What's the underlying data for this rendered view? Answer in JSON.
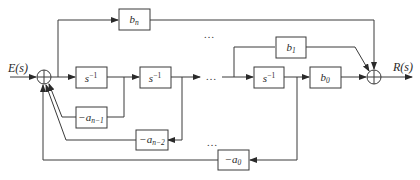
{
  "diagram": {
    "type": "block diagram (controllable canonical form)",
    "input_label": "E(s)",
    "output_label": "R(s)",
    "ellipsis": "…",
    "summing_junctions": [
      {
        "id": "sum-input",
        "cx": 44,
        "cy": 77,
        "r": 7
      },
      {
        "id": "sum-output",
        "cx": 374,
        "cy": 77,
        "r": 7
      }
    ],
    "blocks": {
      "integrator_1": {
        "base": "s",
        "exp": "−1"
      },
      "integrator_2": {
        "base": "s",
        "exp": "−1"
      },
      "integrator_n": {
        "base": "s",
        "exp": "−1"
      },
      "b_n": {
        "base": "b",
        "sub": "n"
      },
      "b_1": {
        "base": "b",
        "sub": "1"
      },
      "b_0": {
        "base": "b",
        "sub": "0"
      },
      "a_n_1": {
        "prefix": "−",
        "base": "a",
        "sub": "n−1"
      },
      "a_n_2": {
        "prefix": "−",
        "base": "a",
        "sub": "n−2"
      },
      "a_0": {
        "prefix": "−",
        "base": "a",
        "sub": "0"
      }
    }
  }
}
